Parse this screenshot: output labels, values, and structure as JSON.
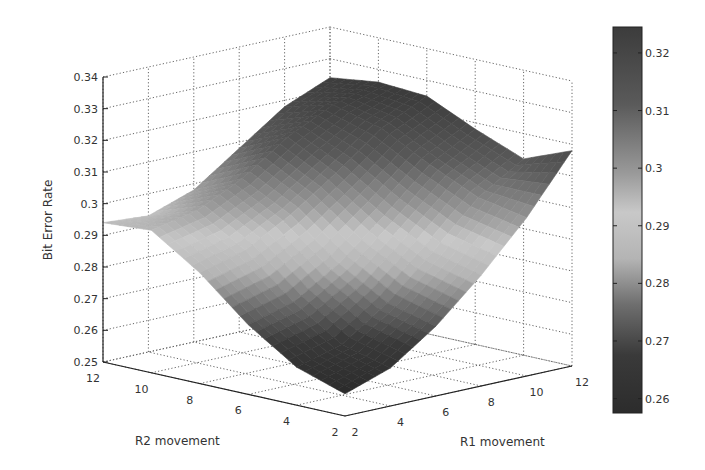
{
  "chart_data": {
    "type": "surface3d",
    "title": "",
    "xlabel": "R1 movement",
    "ylabel": "R2 movement",
    "zlabel": "Bit Error Rate",
    "x_ticks": [
      "2",
      "4",
      "6",
      "8",
      "10",
      "12"
    ],
    "y_ticks": [
      "2",
      "4",
      "6",
      "8",
      "10",
      "12"
    ],
    "z_ticks": [
      "0.25",
      "0.26",
      "0.27",
      "0.28",
      "0.29",
      "0.3",
      "0.31",
      "0.32",
      "0.33",
      "0.34"
    ],
    "xlim": [
      2,
      12
    ],
    "ylim": [
      2,
      12
    ],
    "zlim": [
      0.25,
      0.34
    ],
    "grid": true,
    "colormap": "gray",
    "colorbar": {
      "position": "right",
      "ticks": [
        "0.32",
        "0.31",
        "0.3",
        "0.29",
        "0.28",
        "0.27",
        "0.26"
      ],
      "range": [
        0.2575,
        0.3245
      ]
    },
    "x": [
      2,
      4,
      6,
      8,
      10,
      12
    ],
    "y": [
      2,
      4,
      6,
      8,
      10,
      12
    ],
    "z": [
      [
        0.257,
        0.262,
        0.272,
        0.285,
        0.3,
        0.318
      ],
      [
        0.262,
        0.266,
        0.276,
        0.289,
        0.303,
        0.312
      ],
      [
        0.272,
        0.276,
        0.285,
        0.297,
        0.31,
        0.318
      ],
      [
        0.285,
        0.289,
        0.297,
        0.307,
        0.318,
        0.325
      ],
      [
        0.295,
        0.298,
        0.305,
        0.315,
        0.322,
        0.326
      ],
      [
        0.294,
        0.293,
        0.298,
        0.308,
        0.318,
        0.324
      ]
    ]
  },
  "labels": {
    "zlabel": "Bit Error Rate",
    "xlabel": "R1 movement",
    "ylabel": "R2 movement"
  }
}
